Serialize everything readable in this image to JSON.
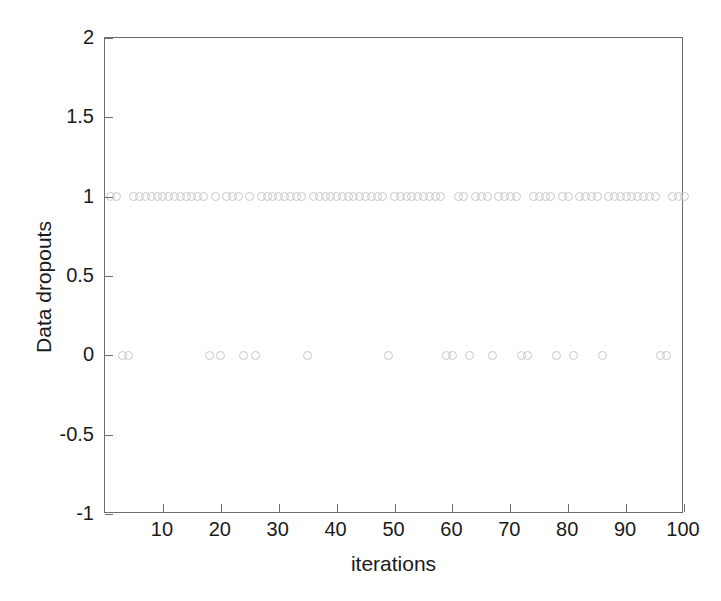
{
  "chart_data": {
    "type": "scatter",
    "title": "",
    "xlabel": "iterations",
    "ylabel": "Data dropouts",
    "xlim": [
      0,
      100
    ],
    "ylim": [
      -1,
      2
    ],
    "xticks": [
      10,
      20,
      30,
      40,
      50,
      60,
      70,
      80,
      90,
      100
    ],
    "xtick_labels": [
      "10",
      "20",
      "30",
      "40",
      "50",
      "60",
      "70",
      "80",
      "90",
      "100"
    ],
    "yticks": [
      -1,
      -0.5,
      0,
      0.5,
      1,
      1.5,
      2
    ],
    "ytick_labels": [
      "-1",
      "-0.5",
      "0",
      "0.5",
      "1",
      "1.5",
      "2"
    ],
    "grid": false,
    "legend": null,
    "marker": "circle-open",
    "marker_color": "#c8c8c8",
    "marker_size": 9,
    "series": [
      {
        "name": "Data dropouts",
        "x": [
          1,
          2,
          3,
          4,
          5,
          6,
          7,
          8,
          9,
          10,
          11,
          12,
          13,
          14,
          15,
          16,
          17,
          18,
          19,
          20,
          21,
          22,
          23,
          24,
          25,
          26,
          27,
          28,
          29,
          30,
          31,
          32,
          33,
          34,
          35,
          36,
          37,
          38,
          39,
          40,
          41,
          42,
          43,
          44,
          45,
          46,
          47,
          48,
          49,
          50,
          51,
          52,
          53,
          54,
          55,
          56,
          57,
          58,
          59,
          60,
          61,
          62,
          63,
          64,
          65,
          66,
          67,
          68,
          69,
          70,
          71,
          72,
          73,
          74,
          75,
          76,
          77,
          78,
          79,
          80,
          81,
          82,
          83,
          84,
          85,
          86,
          87,
          88,
          89,
          90,
          91,
          92,
          93,
          94,
          95,
          96,
          97,
          98,
          99,
          100
        ],
        "y": [
          1,
          1,
          0,
          0,
          1,
          1,
          1,
          1,
          1,
          1,
          1,
          1,
          1,
          1,
          1,
          1,
          1,
          0,
          1,
          0,
          1,
          1,
          1,
          0,
          1,
          0,
          1,
          1,
          1,
          1,
          1,
          1,
          1,
          1,
          0,
          1,
          1,
          1,
          1,
          1,
          1,
          1,
          1,
          1,
          1,
          1,
          1,
          1,
          0,
          1,
          1,
          1,
          1,
          1,
          1,
          1,
          1,
          1,
          0,
          0,
          1,
          1,
          0,
          1,
          1,
          1,
          0,
          1,
          1,
          1,
          1,
          0,
          0,
          1,
          1,
          1,
          1,
          0,
          1,
          1,
          0,
          1,
          1,
          1,
          1,
          0,
          1,
          1,
          1,
          1,
          1,
          1,
          1,
          1,
          1,
          0,
          0,
          1,
          1,
          1
        ]
      }
    ]
  },
  "axes": {
    "x_title": "iterations",
    "y_title": "Data dropouts"
  }
}
